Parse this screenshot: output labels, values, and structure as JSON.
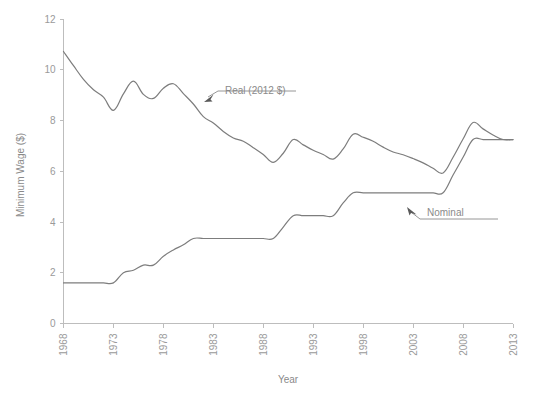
{
  "chart_data": {
    "type": "line",
    "title": "",
    "subtitle": "",
    "xlabel": "Year",
    "ylabel": "Minimum Wage ($)",
    "xlim": [
      1968,
      2013
    ],
    "ylim": [
      0,
      12
    ],
    "xticks": [
      "1968",
      "1973",
      "1978",
      "1983",
      "1988",
      "1993",
      "1998",
      "2003",
      "2008",
      "2013"
    ],
    "yticks": [
      "0",
      "2",
      "4",
      "6",
      "8",
      "10",
      "12"
    ],
    "grid": false,
    "legend_position": "inline-annotations",
    "line_color": "#7d7d7d",
    "axis_color": "#bdbdbd",
    "text_color": "#8a8a8a",
    "background": "#ffffff",
    "x": [
      1968,
      1969,
      1970,
      1971,
      1972,
      1973,
      1974,
      1975,
      1976,
      1977,
      1978,
      1979,
      1980,
      1981,
      1982,
      1983,
      1984,
      1985,
      1986,
      1987,
      1988,
      1989,
      1990,
      1991,
      1992,
      1993,
      1994,
      1995,
      1996,
      1997,
      1998,
      1999,
      2000,
      2001,
      2002,
      2003,
      2004,
      2005,
      2006,
      2007,
      2008,
      2009,
      2010,
      2011,
      2012,
      2013
    ],
    "series": [
      {
        "name": "Real (2012 $)",
        "values": [
          10.72,
          10.16,
          9.62,
          9.21,
          8.92,
          8.4,
          9.05,
          9.55,
          9.03,
          8.87,
          9.27,
          9.45,
          9.06,
          8.65,
          8.15,
          7.9,
          7.57,
          7.31,
          7.18,
          6.93,
          6.66,
          6.35,
          6.71,
          7.25,
          7.04,
          6.83,
          6.66,
          6.48,
          6.88,
          7.46,
          7.34,
          7.18,
          6.95,
          6.76,
          6.65,
          6.5,
          6.33,
          6.12,
          5.93,
          6.55,
          7.27,
          7.92,
          7.67,
          7.43,
          7.25,
          7.25
        ]
      },
      {
        "name": "Nominal",
        "values": [
          1.6,
          1.6,
          1.6,
          1.6,
          1.6,
          1.6,
          2.0,
          2.1,
          2.3,
          2.3,
          2.65,
          2.9,
          3.1,
          3.35,
          3.35,
          3.35,
          3.35,
          3.35,
          3.35,
          3.35,
          3.35,
          3.35,
          3.8,
          4.25,
          4.25,
          4.25,
          4.25,
          4.25,
          4.75,
          5.15,
          5.15,
          5.15,
          5.15,
          5.15,
          5.15,
          5.15,
          5.15,
          5.15,
          5.15,
          5.85,
          6.55,
          7.25,
          7.25,
          7.25,
          7.25,
          7.25
        ]
      }
    ],
    "annotations": [
      {
        "text": "Real (2012 $)",
        "series": "Real (2012 $)",
        "target_year": 1981,
        "target_value": 8.65
      },
      {
        "text": "Nominal",
        "series": "Nominal",
        "target_year": 2003,
        "target_value": 5.15
      }
    ]
  }
}
